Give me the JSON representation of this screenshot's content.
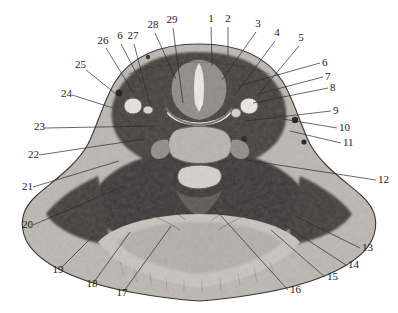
{
  "figure": {
    "kind": "anatomical-cross-section",
    "view": "axial",
    "region": "neck",
    "background_color": "#ffffff",
    "outline_color": "#3a3a3a",
    "leader_color": "#2b2b2b",
    "label_color": "#1a1a1a",
    "label_count": 29
  },
  "labels": [
    {
      "n": "1",
      "x": 211,
      "y": 22,
      "anchor": "middle",
      "lx": 211,
      "ly": 27,
      "tx": 212,
      "ty": 66
    },
    {
      "n": "2",
      "x": 228,
      "y": 22,
      "anchor": "middle",
      "lx": 228,
      "ly": 27,
      "tx": 228,
      "ty": 56
    },
    {
      "n": "3",
      "x": 258,
      "y": 27,
      "anchor": "middle",
      "lx": 256,
      "ly": 32,
      "tx": 222,
      "ty": 80
    },
    {
      "n": "4",
      "x": 277,
      "y": 36,
      "anchor": "middle",
      "lx": 275,
      "ly": 41,
      "tx": 234,
      "ty": 96
    },
    {
      "n": "5",
      "x": 301,
      "y": 41,
      "anchor": "middle",
      "lx": 299,
      "ly": 46,
      "tx": 257,
      "ty": 96
    },
    {
      "n": "6",
      "x": 322,
      "y": 66,
      "anchor": "start",
      "lx": 320,
      "ly": 63,
      "tx": 238,
      "ty": 86
    },
    {
      "n": "7",
      "x": 325,
      "y": 80,
      "anchor": "start",
      "lx": 323,
      "ly": 77,
      "tx": 258,
      "ty": 94
    },
    {
      "n": "8",
      "x": 330,
      "y": 91,
      "anchor": "start",
      "lx": 328,
      "ly": 88,
      "tx": 253,
      "ty": 103
    },
    {
      "n": "9",
      "x": 333,
      "y": 114,
      "anchor": "start",
      "lx": 331,
      "ly": 111,
      "tx": 245,
      "ty": 121
    },
    {
      "n": "10",
      "x": 339,
      "y": 131,
      "anchor": "start",
      "lx": 337,
      "ly": 128,
      "tx": 283,
      "ty": 119
    },
    {
      "n": "11",
      "x": 343,
      "y": 146,
      "anchor": "start",
      "lx": 341,
      "ly": 143,
      "tx": 290,
      "ty": 131
    },
    {
      "n": "12",
      "x": 378,
      "y": 183,
      "anchor": "start",
      "lx": 376,
      "ly": 180,
      "tx": 246,
      "ty": 160
    },
    {
      "n": "13",
      "x": 362,
      "y": 251,
      "anchor": "start",
      "lx": 360,
      "ly": 248,
      "tx": 295,
      "ty": 216
    },
    {
      "n": "14",
      "x": 348,
      "y": 268,
      "anchor": "start",
      "lx": 346,
      "ly": 265,
      "tx": 286,
      "ty": 226
    },
    {
      "n": "15",
      "x": 327,
      "y": 280,
      "anchor": "start",
      "lx": 325,
      "ly": 277,
      "tx": 271,
      "ty": 230
    },
    {
      "n": "16",
      "x": 290,
      "y": 293,
      "anchor": "start",
      "lx": 288,
      "ly": 290,
      "tx": 214,
      "ty": 208
    },
    {
      "n": "17",
      "x": 122,
      "y": 296,
      "anchor": "middle",
      "lx": 124,
      "ly": 291,
      "tx": 171,
      "ty": 226
    },
    {
      "n": "18",
      "x": 92,
      "y": 287,
      "anchor": "middle",
      "lx": 94,
      "ly": 282,
      "tx": 130,
      "ty": 232
    },
    {
      "n": "19",
      "x": 58,
      "y": 273,
      "anchor": "middle",
      "lx": 61,
      "ly": 268,
      "tx": 94,
      "ty": 235
    },
    {
      "n": "20",
      "x": 22,
      "y": 228,
      "anchor": "start",
      "lx": 33,
      "ly": 225,
      "tx": 124,
      "ty": 186
    },
    {
      "n": "21",
      "x": 22,
      "y": 190,
      "anchor": "start",
      "lx": 33,
      "ly": 187,
      "tx": 119,
      "ty": 161
    },
    {
      "n": "22",
      "x": 28,
      "y": 158,
      "anchor": "start",
      "lx": 39,
      "ly": 155,
      "tx": 145,
      "ty": 139
    },
    {
      "n": "23",
      "x": 34,
      "y": 130,
      "anchor": "start",
      "lx": 45,
      "ly": 128,
      "tx": 155,
      "ty": 126
    },
    {
      "n": "24",
      "x": 61,
      "y": 97,
      "anchor": "start",
      "lx": 72,
      "ly": 95,
      "tx": 113,
      "ty": 108
    },
    {
      "n": "25",
      "x": 75,
      "y": 68,
      "anchor": "start",
      "lx": 86,
      "ly": 70,
      "tx": 116,
      "ty": 94
    },
    {
      "n": "26",
      "x": 103,
      "y": 44,
      "anchor": "middle",
      "lx": 106,
      "ly": 48,
      "tx": 133,
      "ty": 92
    },
    {
      "n": "27",
      "x": 133,
      "y": 39,
      "anchor": "middle",
      "lx": 134,
      "ly": 44,
      "tx": 150,
      "ty": 105
    },
    {
      "n": "28",
      "x": 153,
      "y": 28,
      "anchor": "middle",
      "lx": 155,
      "ly": 33,
      "tx": 176,
      "ty": 79
    },
    {
      "n": "29",
      "x": 172,
      "y": 23,
      "anchor": "middle",
      "lx": 173,
      "ly": 28,
      "tx": 183,
      "ty": 103
    },
    {
      "n": "6",
      "x": 120,
      "y": 39,
      "anchor": "middle",
      "lx": 121,
      "ly": 44,
      "tx": 142,
      "ty": 84
    }
  ]
}
